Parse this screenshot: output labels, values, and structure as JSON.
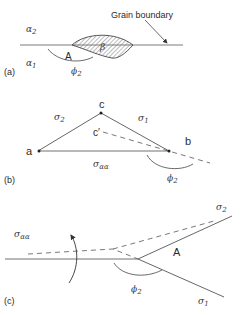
{
  "figure": {
    "panels": [
      {
        "id": "a",
        "panel_label": "(a)",
        "labels": {
          "alpha_upper": "α",
          "alpha_upper_sub": "2",
          "alpha_lower": "α",
          "alpha_lower_sub": "1",
          "point": "A",
          "phase": "β",
          "angle": "ϕ",
          "angle_sub": "2",
          "callout": "Grain boundary"
        }
      },
      {
        "id": "b",
        "panel_label": "(b)",
        "labels": {
          "vertex_a": "a",
          "vertex_b": "b",
          "vertex_c": "c",
          "vertex_c_prime": "c′",
          "sigma_left": "σ",
          "sigma_left_sub": "2",
          "sigma_right": "σ",
          "sigma_right_sub": "1",
          "sigma_base": "σ",
          "sigma_base_sub": "αα",
          "angle": "ϕ",
          "angle_sub": "2"
        }
      },
      {
        "id": "c",
        "panel_label": "(c)",
        "labels": {
          "sigma_aa": "σ",
          "sigma_aa_sub": "αα",
          "point": "A",
          "angle": "ϕ",
          "angle_sub": "2",
          "sigma_upper": "σ",
          "sigma_upper_sub": "2",
          "sigma_lower": "σ",
          "sigma_lower_sub": "1"
        }
      }
    ],
    "colors": {
      "line": "#555555",
      "line_light": "#9a9a9a",
      "hatch": "#666666",
      "text": "#2b2b2b"
    }
  }
}
